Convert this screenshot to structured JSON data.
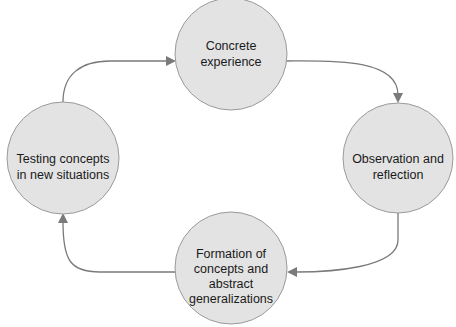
{
  "diagram": {
    "type": "cycle",
    "nodes": [
      {
        "id": "concrete",
        "lines": [
          "Concrete",
          "experience"
        ]
      },
      {
        "id": "observation",
        "lines": [
          "Observation and",
          "reflection"
        ]
      },
      {
        "id": "formation",
        "lines": [
          "Formation of",
          "concepts and",
          "abstract",
          "generalizations"
        ]
      },
      {
        "id": "testing",
        "lines": [
          "Testing concepts",
          "in new situations"
        ]
      }
    ],
    "edges": [
      {
        "from": "concrete",
        "to": "observation"
      },
      {
        "from": "observation",
        "to": "formation"
      },
      {
        "from": "formation",
        "to": "testing"
      },
      {
        "from": "testing",
        "to": "concrete"
      }
    ]
  }
}
